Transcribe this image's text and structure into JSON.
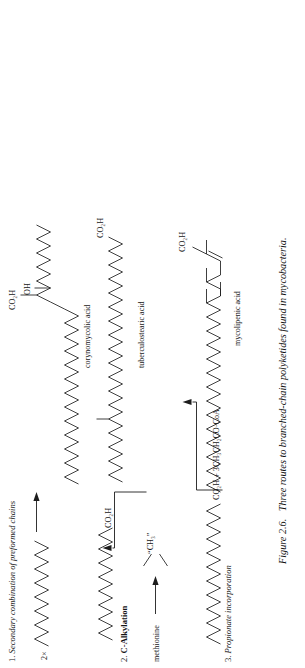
{
  "figure": {
    "caption_number": "Figure 2.6.",
    "caption_text": "Three routes to branched-chain polyketides found in mycobacteria."
  },
  "sections": [
    {
      "id": "secondary-combination",
      "number": "1.",
      "title": "Secondary combination of preformed chains",
      "reagent_label": "2×",
      "arrow": "right-arrow",
      "product_name": "corynomycolic acid",
      "product_groups": [
        "OH",
        "CO₂H"
      ]
    },
    {
      "id": "c-alkylation",
      "number": "2.",
      "title": "C-Alkylation",
      "reagent_label": "methionine",
      "donor_label": "“CH₃”",
      "substrate_group": "CO₂H",
      "arrow": "right-arrow",
      "elbow_arrow": "up-arrow",
      "product_name": "tuberculostearic acid"
    },
    {
      "id": "propionate-incorporation",
      "number": "3.",
      "title": "Propionate incorporation",
      "reagent_label": "CO₂H + 3CH₃CH₂CO·CoA",
      "elbow_arrow": "up-arrow",
      "product_name": "mycolipenic acid",
      "product_groups": [
        "CO₂H"
      ]
    }
  ],
  "labels": {
    "co2h": "CO₂H",
    "oh": "OH",
    "two_times": "2×",
    "methionine": "methionine",
    "methyl_donor": "“CH₃”",
    "propionate_reagent": "CO₂H + 3CH₃CH₂CO·CoA",
    "corynomycolic": "corynomycolic acid",
    "tuberculostearic": "tuberculostearic acid",
    "mycolipenic": "mycolipenic acid"
  },
  "colors": {
    "ink": "#1d1d1d",
    "paper": "#ffffff"
  }
}
